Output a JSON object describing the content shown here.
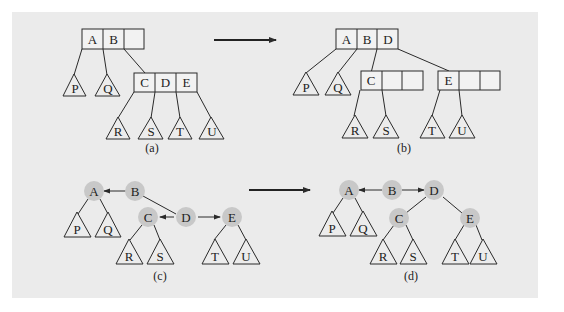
{
  "figure": {
    "background_color": "#ebebeb",
    "node_fill": "#c8c8c8",
    "line_color": "#2a2a2a",
    "panels": [
      {
        "id": "a",
        "caption": "(a)",
        "kind": "2-3-4 tree",
        "root": {
          "keys": [
            "A",
            "B",
            ""
          ]
        },
        "child": {
          "keys": [
            "C",
            "D",
            "E"
          ]
        },
        "subtrees": [
          "P",
          "Q",
          "R",
          "S",
          "T",
          "U"
        ]
      },
      {
        "id": "b",
        "caption": "(b)",
        "kind": "2-3-4 tree after split",
        "root": {
          "keys": [
            "A",
            "B",
            "D"
          ]
        },
        "children": [
          {
            "keys": [
              "C",
              "",
              ""
            ]
          },
          {
            "keys": [
              "E",
              "",
              ""
            ]
          }
        ],
        "subtrees": [
          "P",
          "Q",
          "R",
          "S",
          "T",
          "U"
        ]
      },
      {
        "id": "c",
        "caption": "(c)",
        "kind": "red-black tree",
        "nodes": [
          "A",
          "B",
          "C",
          "D",
          "E"
        ],
        "subtrees": [
          "P",
          "Q",
          "R",
          "S",
          "T",
          "U"
        ]
      },
      {
        "id": "d",
        "caption": "(d)",
        "kind": "red-black tree after split",
        "nodes": [
          "A",
          "B",
          "C",
          "D",
          "E"
        ],
        "subtrees": [
          "P",
          "Q",
          "R",
          "S",
          "T",
          "U"
        ]
      }
    ]
  }
}
